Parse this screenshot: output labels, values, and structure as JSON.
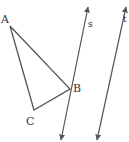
{
  "diagram": {
    "type": "geometry",
    "stroke_color": "#555555",
    "label_color": "#333333",
    "triangle": {
      "vertices": [
        {
          "label": "A",
          "x": 10,
          "y": 26,
          "label_x": 2,
          "label_y": 23
        },
        {
          "label": "B",
          "x": 70,
          "y": 89,
          "label_x": 74,
          "label_y": 92
        },
        {
          "label": "C",
          "x": 34,
          "y": 110,
          "label_x": 27,
          "label_y": 125
        }
      ]
    },
    "lines": [
      {
        "label": "s",
        "x1": 88,
        "y1": 6,
        "x2": 61,
        "y2": 141,
        "label_x": 88,
        "label_y": 27
      },
      {
        "label": "t",
        "x1": 126,
        "y1": 6,
        "x2": 97,
        "y2": 141,
        "label_x": 123,
        "label_y": 22
      }
    ]
  }
}
